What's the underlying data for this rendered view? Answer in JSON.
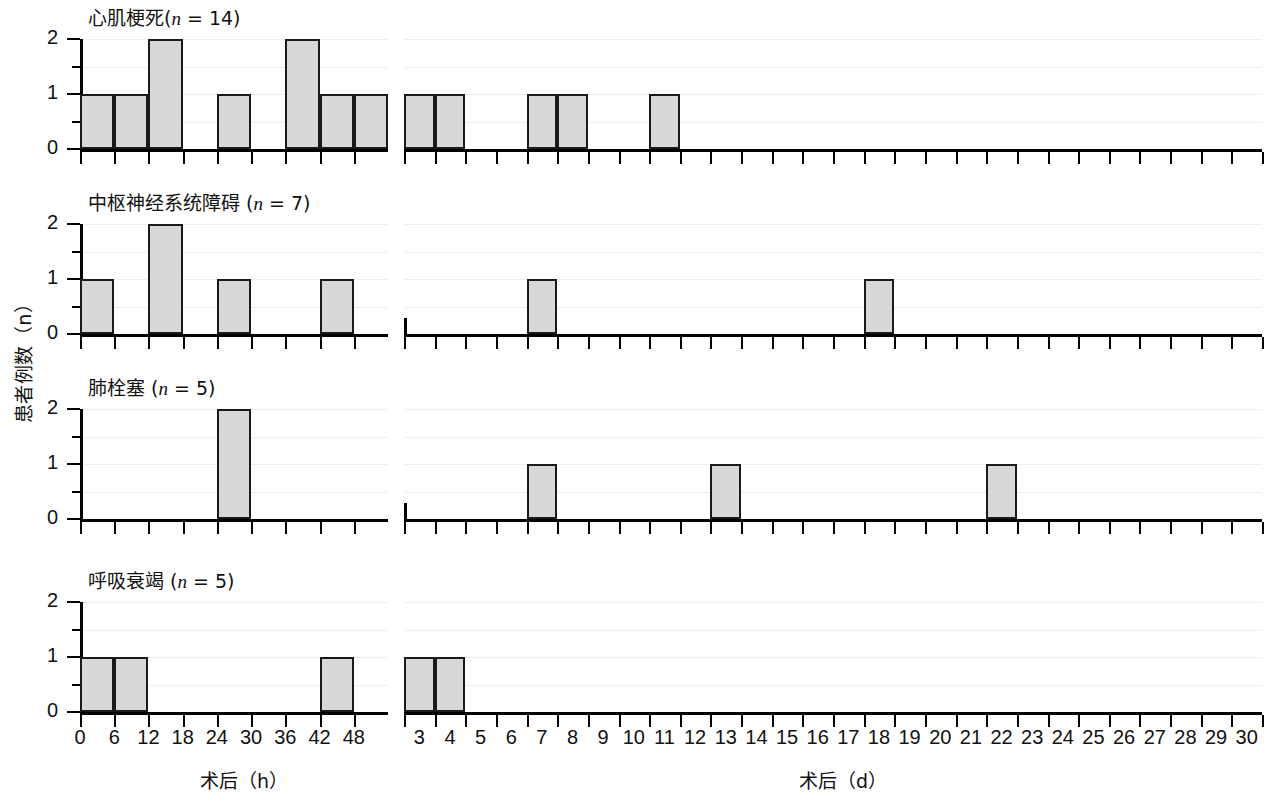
{
  "figure": {
    "ylabel": "患者例数（n）",
    "left_axis_caption": "术后（h）",
    "right_axis_caption": "术后（d）",
    "y_ticks": [
      "0",
      "1",
      "2"
    ],
    "y_range": [
      0,
      2
    ],
    "left_x_ticks": [
      "0",
      "6",
      "12",
      "18",
      "24",
      "30",
      "36",
      "42",
      "48"
    ],
    "right_x_ticks": [
      "3",
      "4",
      "5",
      "6",
      "7",
      "8",
      "9",
      "10",
      "11",
      "12",
      "13",
      "14",
      "15",
      "16",
      "17",
      "18",
      "19",
      "20",
      "21",
      "22",
      "23",
      "24",
      "25",
      "26",
      "27",
      "28",
      "29",
      "30"
    ],
    "bar_fill": "#d8d8d8",
    "bar_stroke": "#1a1a1a"
  },
  "panels": [
    {
      "title_cn": "心肌梗死",
      "title_n": "(n = 14)",
      "title_full": "心肌梗死(n = 14)"
    },
    {
      "title_cn": "中枢神经系统障碍",
      "title_n": "(n = 7)",
      "title_full": "中枢神经系统障碍 (n = 7)"
    },
    {
      "title_cn": "肺栓塞",
      "title_n": "(n = 5)",
      "title_full": "肺栓塞 (n = 5)"
    },
    {
      "title_cn": "呼吸衰竭",
      "title_n": "(n = 5)",
      "title_full": "呼吸衰竭 (n = 5)"
    }
  ],
  "chart_data": {
    "type": "bar",
    "title": "",
    "xlabel_left": "术后（h）",
    "xlabel_right": "术后（d）",
    "ylabel": "患者例数（n）",
    "ylim": [
      0,
      2
    ],
    "grid": true,
    "legend": "none",
    "note": "Histogram of postoperative complication onset times; left sub-axis in 6-hour bins (0-48 h), right sub-axis in 1-day bins (3-30 d). Bars are drawn spanning the bin interval starting at the listed value.",
    "panels": [
      {
        "name": "心肌梗死(n = 14)",
        "n": 14,
        "hours": {
          "bin_starts": [
            0,
            6,
            12,
            18,
            24,
            30,
            36,
            42
          ],
          "values": [
            1,
            1,
            2,
            0,
            1,
            0,
            2,
            1
          ],
          "extra_bin": {
            "start": 48,
            "value": 1
          }
        },
        "days": {
          "bin_starts": [
            3,
            4,
            5,
            6,
            7,
            8,
            9,
            10,
            11,
            12,
            13,
            14,
            15,
            16,
            17,
            18,
            19,
            20,
            21,
            22,
            23,
            24,
            25,
            26,
            27,
            28,
            29,
            30
          ],
          "values": [
            1,
            1,
            0,
            0,
            1,
            1,
            0,
            0,
            1,
            0,
            0,
            0,
            0,
            0,
            0,
            0,
            0,
            0,
            0,
            0,
            0,
            0,
            0,
            0,
            0,
            0,
            0,
            0
          ]
        }
      },
      {
        "name": "中枢神经系统障碍 (n = 7)",
        "n": 7,
        "hours": {
          "bin_starts": [
            0,
            6,
            12,
            18,
            24,
            30,
            36,
            42
          ],
          "values": [
            1,
            0,
            2,
            0,
            1,
            0,
            0,
            1
          ],
          "extra_bin": {
            "start": 48,
            "value": 0
          }
        },
        "days": {
          "bin_starts": [
            3,
            4,
            5,
            6,
            7,
            8,
            9,
            10,
            11,
            12,
            13,
            14,
            15,
            16,
            17,
            18,
            19,
            20,
            21,
            22,
            23,
            24,
            25,
            26,
            27,
            28,
            29,
            30
          ],
          "values": [
            0,
            0,
            0,
            0,
            1,
            0,
            0,
            0,
            0,
            0,
            0,
            0,
            0,
            0,
            0,
            1,
            0,
            0,
            0,
            0,
            0,
            0,
            0,
            0,
            0,
            0,
            0,
            0
          ]
        }
      },
      {
        "name": "肺栓塞 (n = 5)",
        "n": 5,
        "hours": {
          "bin_starts": [
            0,
            6,
            12,
            18,
            24,
            30,
            36,
            42
          ],
          "values": [
            0,
            0,
            0,
            0,
            2,
            0,
            0,
            0
          ],
          "extra_bin": {
            "start": 48,
            "value": 0
          }
        },
        "days": {
          "bin_starts": [
            3,
            4,
            5,
            6,
            7,
            8,
            9,
            10,
            11,
            12,
            13,
            14,
            15,
            16,
            17,
            18,
            19,
            20,
            21,
            22,
            23,
            24,
            25,
            26,
            27,
            28,
            29,
            30
          ],
          "values": [
            0,
            0,
            0,
            0,
            1,
            0,
            0,
            0,
            0,
            0,
            1,
            0,
            0,
            0,
            0,
            0,
            0,
            0,
            0,
            1,
            0,
            0,
            0,
            0,
            0,
            0,
            0,
            0
          ]
        }
      },
      {
        "name": "呼吸衰竭 (n = 5)",
        "n": 5,
        "hours": {
          "bin_starts": [
            0,
            6,
            12,
            18,
            24,
            30,
            36,
            42
          ],
          "values": [
            1,
            1,
            0,
            0,
            0,
            0,
            0,
            1
          ],
          "extra_bin": {
            "start": 48,
            "value": 0
          }
        },
        "days": {
          "bin_starts": [
            3,
            4,
            5,
            6,
            7,
            8,
            9,
            10,
            11,
            12,
            13,
            14,
            15,
            16,
            17,
            18,
            19,
            20,
            21,
            22,
            23,
            24,
            25,
            26,
            27,
            28,
            29,
            30
          ],
          "values": [
            1,
            1,
            0,
            0,
            0,
            0,
            0,
            0,
            0,
            0,
            0,
            0,
            0,
            0,
            0,
            0,
            0,
            0,
            0,
            0,
            0,
            0,
            0,
            0,
            0,
            0,
            0,
            0
          ]
        }
      }
    ]
  }
}
